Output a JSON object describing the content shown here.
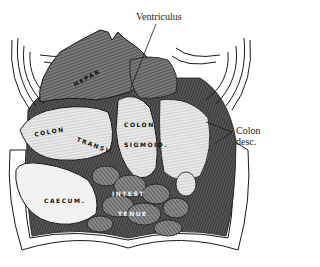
{
  "figure": {
    "type": "anatomical-engraving",
    "colors": {
      "ink": "#1a1a1a",
      "shade": "#6b6b6b",
      "mid": "#9a9a9a",
      "paper": "#ffffff",
      "organ_light": "#eeeeee"
    }
  },
  "callouts": {
    "ventriculus": "Ventriculus",
    "colon_desc_line1": "Colon",
    "colon_desc_line2": "desc."
  },
  "organ_labels": {
    "hepar": "HEPAR",
    "colon_transv": "COLON",
    "transv": "TRANSV.",
    "colon_sigmoid_1": "COLON",
    "colon_sigmoid_2": "SIGMOID.",
    "caecum": "CAECUM.",
    "intest": "INTEST",
    "tenue": "TENUE"
  }
}
